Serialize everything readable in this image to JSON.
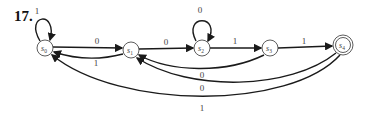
{
  "problem": {
    "number": "17."
  },
  "diagram": {
    "type": "finite-state-automaton",
    "states": [
      {
        "id": "s0",
        "name": "s",
        "sub": "0",
        "x": 45,
        "y": 48,
        "accepting": false,
        "start": false
      },
      {
        "id": "s1",
        "name": "s",
        "sub": "1",
        "x": 131,
        "y": 50,
        "accepting": false,
        "start": false
      },
      {
        "id": "s2",
        "name": "s",
        "sub": "2",
        "x": 202,
        "y": 48,
        "accepting": false,
        "start": false
      },
      {
        "id": "s3",
        "name": "s",
        "sub": "3",
        "x": 270,
        "y": 48,
        "accepting": false,
        "start": false
      },
      {
        "id": "s4",
        "name": "s",
        "sub": "4",
        "x": 343,
        "y": 45,
        "accepting": true,
        "start": false
      }
    ],
    "transitions": [
      {
        "from": "s0",
        "to": "s0",
        "label": "1"
      },
      {
        "from": "s0",
        "to": "s1",
        "label": "0"
      },
      {
        "from": "s1",
        "to": "s0",
        "label": "1"
      },
      {
        "from": "s1",
        "to": "s2",
        "label": "0"
      },
      {
        "from": "s2",
        "to": "s2",
        "label": "0"
      },
      {
        "from": "s2",
        "to": "s3",
        "label": "1"
      },
      {
        "from": "s3",
        "to": "s4",
        "label": "1"
      },
      {
        "from": "s3",
        "to": "s1",
        "label": "0"
      },
      {
        "from": "s4",
        "to": "s1",
        "label": "0"
      },
      {
        "from": "s4",
        "to": "s0",
        "label": "1"
      }
    ]
  }
}
